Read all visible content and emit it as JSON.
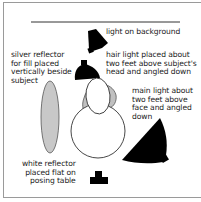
{
  "diagram": {
    "labels": {
      "background_light": "light on background",
      "hair_light": "hair light placed about\ntwo feet above subject's\nhead and angled down",
      "silver_reflector": "silver reflector\nfor fill placed\nvertically beside\nsubject",
      "main_light": "main light about\ntwo feet above\nface and angled\ndown",
      "white_reflector": "white reflector\nplaced flat on\nposing table"
    },
    "colors": {
      "frame": "#9a9a9a",
      "light_fill": "#000000",
      "reflector_fill": "#c8c8c8",
      "outline": "#555555",
      "background_line": "#333333"
    }
  }
}
